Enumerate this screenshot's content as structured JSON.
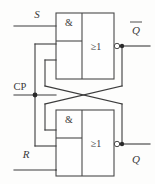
{
  "diagram": {
    "type": "logic-circuit",
    "width": 155,
    "height": 184,
    "colors": {
      "wire": "#3c3c3c",
      "box": "#4a4a4a",
      "background": "#fdfdfc",
      "text": "#3a3a3a"
    },
    "inputs": [
      {
        "id": "S",
        "label": "S",
        "style": "italic",
        "position": "top-left",
        "label_x": 37,
        "label_y": 17,
        "wire_y": 26
      },
      {
        "id": "CP",
        "label": "CP",
        "style": "roman",
        "position": "middle-left",
        "label_x": 20,
        "label_y": 89,
        "wire_y": 95
      },
      {
        "id": "R",
        "label": "R",
        "style": "italic",
        "position": "bottom-left",
        "label_x": 25,
        "label_y": 157,
        "wire_y": 170
      }
    ],
    "outputs": [
      {
        "id": "Qbar",
        "label": "Q",
        "overline": true,
        "position": "top-right",
        "label_x": 135,
        "label_y": 32,
        "wire_y": 46
      },
      {
        "id": "Q",
        "label": "Q",
        "overline": false,
        "position": "bottom-right",
        "label_x": 135,
        "label_y": 160,
        "wire_y": 144
      }
    ],
    "gates": [
      {
        "id": "top-gate",
        "and_symbol": "&",
        "or_symbol": "≥1",
        "x": 56,
        "y": 13,
        "w": 58,
        "h": 66,
        "and_w": 26,
        "and_h": 28,
        "and_sym_x": 69,
        "and_sym_y": 26,
        "or_sym_x": 96,
        "or_sym_y": 50,
        "inverted_output": true
      },
      {
        "id": "bottom-gate",
        "and_symbol": "&",
        "or_symbol": "≥1",
        "x": 56,
        "y": 110,
        "w": 58,
        "h": 66,
        "and_w": 26,
        "and_h": 28,
        "and_sym_x": 69,
        "and_sym_y": 123,
        "or_sym_x": 96,
        "or_sym_y": 147,
        "inverted_output": true
      }
    ],
    "junctions": [
      {
        "id": "cp-tap",
        "x": 35,
        "y": 95
      },
      {
        "id": "qbar-tap",
        "x": 122,
        "y": 46
      },
      {
        "id": "q-tap",
        "x": 122,
        "y": 144
      }
    ],
    "bubbles": [
      {
        "id": "top-output-bubble",
        "x": 117,
        "y": 46,
        "r": 2.6
      },
      {
        "id": "bottom-output-bubble",
        "x": 117,
        "y": 144,
        "r": 2.6
      }
    ],
    "notes": {
      "cross_coupling": "Q output feeds back to top gate AND input; Q-bar output feeds back to bottom gate AND input, drawn as crossing lines",
      "clock_bus": "CP branches upward to top gate and downward to bottom gate"
    }
  }
}
